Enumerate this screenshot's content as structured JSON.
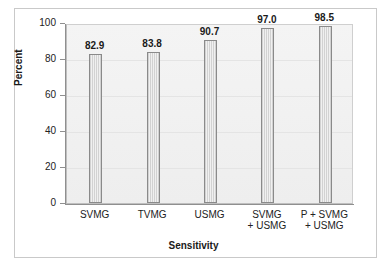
{
  "chart_data": {
    "type": "bar",
    "title": "",
    "xlabel": "Sensitivity",
    "ylabel": "Percent",
    "categories": [
      "SVMG",
      "TVMG",
      "USMG",
      "SVMG\n+ USMG",
      "P + SVMG\n+ USMG"
    ],
    "values": [
      82.9,
      83.8,
      90.7,
      97.0,
      98.5
    ],
    "value_labels": [
      "82.9",
      "83.8",
      "90.7",
      "97.0",
      "98.5"
    ],
    "ylim": [
      0,
      100
    ],
    "yticks": [
      0,
      20,
      40,
      60,
      80,
      100
    ],
    "ytick_labels": [
      "0",
      "20",
      "40",
      "60",
      "80",
      "100"
    ],
    "grid": true,
    "grid_axis": "y",
    "legend": "none",
    "bar_fill_color": "#e3e3e3",
    "bar_edge_color": "#8a8a8a",
    "plot_background_color": "#f2f2f2",
    "figure_background_color": "#ffffff",
    "axis_color": "#8f8f8f",
    "text_color": "#1a1a1a"
  }
}
